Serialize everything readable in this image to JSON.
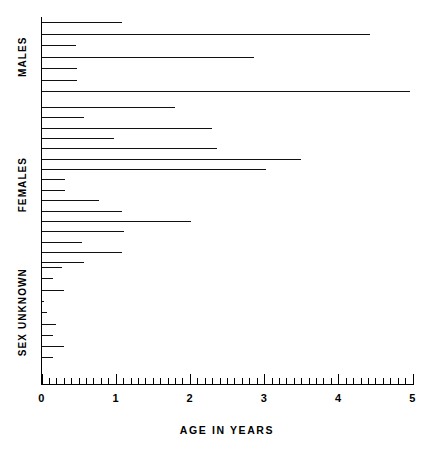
{
  "chart_data": {
    "type": "bar",
    "orientation": "horizontal",
    "title": "",
    "subtitle": "",
    "xlabel": "AGE IN YEARS",
    "ylabel": "",
    "xlim": [
      0,
      5
    ],
    "grid": false,
    "legend": null,
    "x_major_ticks": [
      0,
      1,
      2,
      3,
      4,
      5
    ],
    "x_tick_labels": [
      "0",
      "1",
      "2",
      "3",
      "4",
      "5"
    ],
    "x_minor_tick_step": 0.1,
    "groups": [
      {
        "label": "MALES",
        "values": [
          1.08,
          4.43,
          0.46,
          2.87,
          0.48,
          0.48,
          4.97
        ]
      },
      {
        "label": "FEMALES",
        "values": [
          1.8,
          0.57,
          2.3,
          0.98,
          2.37,
          3.5,
          3.02,
          0.32,
          0.32,
          0.77,
          1.08,
          2.01,
          1.11,
          0.54,
          1.09,
          0.57
        ]
      },
      {
        "label": "SEX UNKNOWN",
        "values": [
          0.28,
          0.16,
          0.3,
          0.04,
          0.08,
          0.19,
          0.15,
          0.3,
          0.15
        ]
      }
    ]
  },
  "colors": {
    "bar": "#111111",
    "axis": "#000000",
    "background": "#ffffff"
  }
}
